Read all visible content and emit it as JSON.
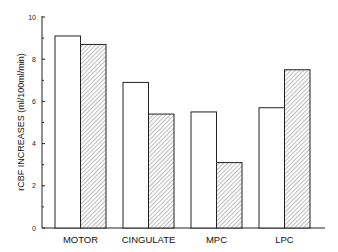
{
  "chart_data": {
    "type": "bar",
    "title": "",
    "xlabel": "",
    "ylabel": "rCBF INCREASES (ml/100ml/min)",
    "ylim": [
      0,
      10
    ],
    "yticks": [
      "0",
      "2",
      "4",
      "6",
      "8",
      "10"
    ],
    "categories": [
      "MOTOR",
      "CINGULATE",
      "MPC",
      "LPC"
    ],
    "series": [
      {
        "name": "open",
        "pattern": "none",
        "values": [
          9.1,
          6.9,
          5.5,
          5.7
        ]
      },
      {
        "name": "hatched",
        "pattern": "diagonal-hatch",
        "values": [
          8.7,
          5.4,
          3.1,
          7.5
        ]
      }
    ],
    "grid": false,
    "legend": "none"
  }
}
